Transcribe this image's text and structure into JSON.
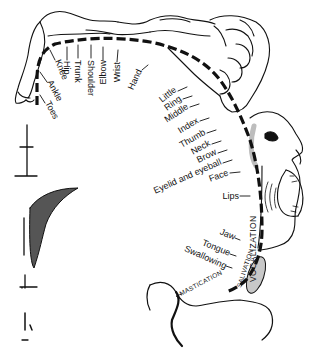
{
  "diagram": {
    "colors": {
      "ink": "#111111",
      "background": "#ffffff",
      "shading": "#bdbdbd"
    },
    "labels": [
      {
        "id": "toes",
        "text": "Toes"
      },
      {
        "id": "ankle",
        "text": "Ankle"
      },
      {
        "id": "knee",
        "text": "Knee"
      },
      {
        "id": "hip",
        "text": "Hip"
      },
      {
        "id": "trunk",
        "text": "Trunk"
      },
      {
        "id": "shoulder",
        "text": "Shoulder"
      },
      {
        "id": "elbow",
        "text": "Elbow"
      },
      {
        "id": "wrist",
        "text": "Wrist"
      },
      {
        "id": "hand",
        "text": "Hand"
      },
      {
        "id": "little",
        "text": "Little"
      },
      {
        "id": "ring",
        "text": "Ring"
      },
      {
        "id": "middle",
        "text": "Middle"
      },
      {
        "id": "index",
        "text": "Index"
      },
      {
        "id": "thumb",
        "text": "Thumb"
      },
      {
        "id": "neck",
        "text": "Neck"
      },
      {
        "id": "brow",
        "text": "Brow"
      },
      {
        "id": "eyelid",
        "text": "Eyelid and eyeball"
      },
      {
        "id": "face",
        "text": "Face"
      },
      {
        "id": "lips",
        "text": "Lips"
      },
      {
        "id": "jaw",
        "text": "Jaw"
      },
      {
        "id": "tongue",
        "text": "Tongue"
      },
      {
        "id": "swallowing",
        "text": "Swallowing"
      }
    ],
    "functions": {
      "vocalization": "VOCALIZATION",
      "salivation": "SALIVATION",
      "mastication": "MASTICATION"
    }
  }
}
